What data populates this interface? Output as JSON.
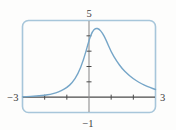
{
  "chart_data": {
    "type": "line",
    "title": "",
    "xlabel": "",
    "ylabel": "",
    "xlim": [
      -3,
      3
    ],
    "ylim": [
      -1,
      5
    ],
    "x_ticks": [
      -2,
      -1,
      1,
      2
    ],
    "y_ticks": [
      1,
      2,
      3,
      4
    ],
    "axis_labels": {
      "top": "5",
      "left": "−3",
      "right": "3",
      "bottom": "−1"
    },
    "series": [
      {
        "name": "bell-shaped-curve",
        "points": [
          [
            -3.0,
            0.02
          ],
          [
            -2.75,
            0.04
          ],
          [
            -2.5,
            0.06
          ],
          [
            -2.25,
            0.09
          ],
          [
            -2.0,
            0.13
          ],
          [
            -1.75,
            0.19
          ],
          [
            -1.5,
            0.28
          ],
          [
            -1.25,
            0.42
          ],
          [
            -1.0,
            0.62
          ],
          [
            -0.75,
            0.95
          ],
          [
            -0.5,
            1.5
          ],
          [
            -0.25,
            2.4
          ],
          [
            0.0,
            3.7
          ],
          [
            0.15,
            4.3
          ],
          [
            0.3,
            4.5
          ],
          [
            0.45,
            4.45
          ],
          [
            0.6,
            4.2
          ],
          [
            0.75,
            3.8
          ],
          [
            1.0,
            2.95
          ],
          [
            1.25,
            2.35
          ],
          [
            1.5,
            1.85
          ],
          [
            1.75,
            1.5
          ],
          [
            2.0,
            1.2
          ],
          [
            2.25,
            0.97
          ],
          [
            2.5,
            0.78
          ],
          [
            2.75,
            0.63
          ],
          [
            3.0,
            0.5
          ]
        ]
      }
    ],
    "layout_hints": {
      "grid": "off",
      "legend": "none",
      "frame_style": "rounded viewing rectangle"
    },
    "colors": {
      "frame": "#a7c6da",
      "curve": "#76a6c8",
      "x_axis": "#4a4a4a",
      "y_axis": "#8f8f8f",
      "tick": "#4a4a4a",
      "label": "#3b3b3b",
      "background": "#fdfdfc"
    }
  }
}
